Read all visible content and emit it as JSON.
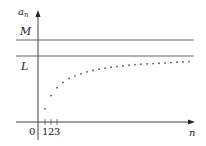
{
  "chart_data": {
    "type": "scatter",
    "title": "",
    "xlabel": "n",
    "ylabel": "a_n",
    "origin_label": "0",
    "x_ticks": [
      "1",
      "2",
      "3"
    ],
    "horizontal_lines": [
      {
        "label": "M",
        "description": "upper bound"
      },
      {
        "label": "L",
        "description": "limit"
      }
    ],
    "x": [
      1,
      2,
      3,
      4,
      5,
      6,
      7,
      8,
      9,
      10,
      11,
      12,
      13,
      14,
      15,
      16,
      17,
      18,
      19,
      20,
      21,
      22,
      23,
      24,
      25
    ],
    "values": [
      0.2,
      0.4,
      0.52,
      0.6,
      0.66,
      0.7,
      0.73,
      0.76,
      0.78,
      0.8,
      0.815,
      0.83,
      0.84,
      0.85,
      0.86,
      0.87,
      0.875,
      0.88,
      0.885,
      0.89,
      0.895,
      0.9,
      0.905,
      0.91,
      0.915
    ],
    "grid": false
  },
  "labels": {
    "y_axis": "a",
    "y_axis_sub": "n",
    "x_axis": "n",
    "origin": "0",
    "M": "M",
    "L": "L",
    "tick1": "1",
    "tick2": "2",
    "tick3": "3"
  }
}
